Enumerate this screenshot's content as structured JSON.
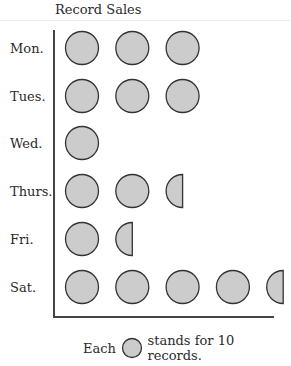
{
  "chart_data": {
    "type": "pictograph",
    "title": "Record Sales",
    "categories": [
      "Mon.",
      "Tues.",
      "Wed.",
      "Thurs.",
      "Fri.",
      "Sat."
    ],
    "symbols": [
      3,
      3,
      1,
      2.5,
      1.5,
      4.5
    ],
    "values": [
      30,
      30,
      10,
      25,
      15,
      45
    ],
    "unit_value": 10,
    "legend": {
      "prefix": "Each",
      "suffix": "stands for 10 records."
    },
    "symbol_color": "#cccccc",
    "stroke_color": "#333333"
  }
}
